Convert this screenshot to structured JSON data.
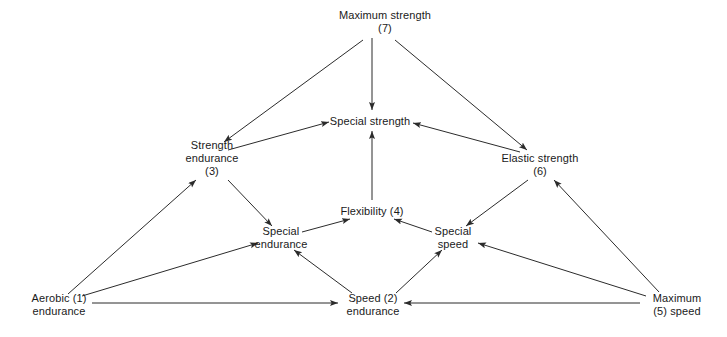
{
  "diagram": {
    "line_color": "#2b2b2b",
    "text_color": "#1a1a1a",
    "background": "#ffffff",
    "nodes": [
      {
        "id": "maximum-strength",
        "label_line1": "Maximum strength",
        "label_line2": "(7)",
        "x": 385,
        "y": 22
      },
      {
        "id": "special-strength",
        "label_line1": "Special strength",
        "label_line2": "",
        "x": 370,
        "y": 121
      },
      {
        "id": "strength-endurance",
        "label_line1": "Strength",
        "label_line2": "endurance",
        "label_line3": "(3)",
        "x": 212,
        "y": 158
      },
      {
        "id": "elastic-strength",
        "label_line1": "Elastic strength",
        "label_line2": "(6)",
        "x": 540,
        "y": 165
      },
      {
        "id": "flexibility",
        "label_line1": "Flexibility (4)",
        "label_line2": "",
        "x": 372,
        "y": 211
      },
      {
        "id": "special-endurance",
        "label_line1": "Special",
        "label_line2": "endurance",
        "x": 281,
        "y": 238
      },
      {
        "id": "special-speed",
        "label_line1": "Special",
        "label_line2": "speed",
        "x": 453,
        "y": 238
      },
      {
        "id": "aerobic-endurance",
        "label_line1": "Aerobic (1)",
        "label_line2": "endurance",
        "x": 59,
        "y": 305
      },
      {
        "id": "speed-endurance",
        "label_line1": "Speed (2)",
        "label_line2": "endurance",
        "x": 373,
        "y": 305
      },
      {
        "id": "maximum-speed",
        "label_line1": "Maximum",
        "label_line2": "(5) speed",
        "x": 677,
        "y": 305
      }
    ],
    "edges": [
      {
        "id": "max-strength-to-strength-endurance",
        "from": "maximum-strength",
        "to": "strength-endurance",
        "x1": 363,
        "y1": 40,
        "x2": 224,
        "y2": 142
      },
      {
        "id": "max-strength-to-special-strength",
        "from": "maximum-strength",
        "to": "special-strength",
        "x1": 372,
        "y1": 38,
        "x2": 372,
        "y2": 110
      },
      {
        "id": "max-strength-to-elastic-strength",
        "from": "maximum-strength",
        "to": "elastic-strength",
        "x1": 395,
        "y1": 40,
        "x2": 527,
        "y2": 150
      },
      {
        "id": "strength-endurance-to-special-strength",
        "from": "strength-endurance",
        "to": "special-strength",
        "x1": 228,
        "y1": 150,
        "x2": 329,
        "y2": 122
      },
      {
        "id": "elastic-strength-to-special-strength",
        "from": "elastic-strength",
        "to": "special-strength",
        "x1": 520,
        "y1": 152,
        "x2": 413,
        "y2": 123
      },
      {
        "id": "flexibility-to-special-strength",
        "from": "flexibility",
        "to": "special-strength",
        "x1": 372,
        "y1": 200,
        "x2": 372,
        "y2": 131
      },
      {
        "id": "strength-endurance-to-special-endurance",
        "from": "strength-endurance",
        "to": "special-endurance",
        "x1": 228,
        "y1": 180,
        "x2": 272,
        "y2": 226
      },
      {
        "id": "elastic-strength-to-special-speed",
        "from": "elastic-strength",
        "to": "special-speed",
        "x1": 528,
        "y1": 180,
        "x2": 466,
        "y2": 226
      },
      {
        "id": "special-endurance-to-flexibility",
        "from": "special-endurance",
        "to": "flexibility",
        "x1": 302,
        "y1": 232,
        "x2": 350,
        "y2": 219
      },
      {
        "id": "special-speed-to-flexibility",
        "from": "special-speed",
        "to": "flexibility",
        "x1": 432,
        "y1": 232,
        "x2": 394,
        "y2": 219
      },
      {
        "id": "aerobic-endurance-to-strength-endurance",
        "from": "aerobic-endurance",
        "to": "strength-endurance",
        "x1": 68,
        "y1": 294,
        "x2": 196,
        "y2": 180
      },
      {
        "id": "aerobic-endurance-to-special-endurance",
        "from": "aerobic-endurance",
        "to": "special-endurance",
        "x1": 82,
        "y1": 296,
        "x2": 258,
        "y2": 243
      },
      {
        "id": "aerobic-endurance-to-speed-endurance",
        "from": "aerobic-endurance",
        "to": "speed-endurance",
        "x1": 92,
        "y1": 303,
        "x2": 338,
        "y2": 303
      },
      {
        "id": "speed-endurance-to-special-endurance",
        "from": "speed-endurance",
        "to": "special-endurance",
        "x1": 352,
        "y1": 293,
        "x2": 294,
        "y2": 250
      },
      {
        "id": "speed-endurance-to-special-speed",
        "from": "speed-endurance",
        "to": "special-speed",
        "x1": 396,
        "y1": 293,
        "x2": 442,
        "y2": 250
      },
      {
        "id": "maximum-speed-to-speed-endurance",
        "from": "maximum-speed",
        "to": "speed-endurance",
        "x1": 640,
        "y1": 303,
        "x2": 404,
        "y2": 303
      },
      {
        "id": "maximum-speed-to-special-speed",
        "from": "maximum-speed",
        "to": "special-speed",
        "x1": 646,
        "y1": 296,
        "x2": 478,
        "y2": 243
      },
      {
        "id": "maximum-speed-to-elastic-strength",
        "from": "maximum-speed",
        "to": "elastic-strength",
        "x1": 659,
        "y1": 292,
        "x2": 554,
        "y2": 180
      }
    ]
  }
}
